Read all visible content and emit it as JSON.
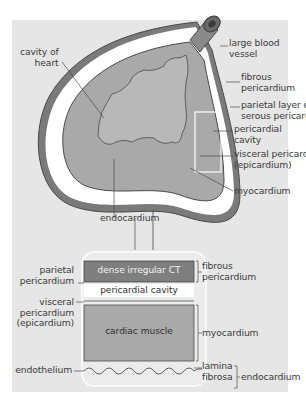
{
  "diagram": {
    "colors": {
      "background": "#e6e6e6",
      "fibrous_pericardium": "#7f7f7f",
      "myocardium": "#a9a9a9",
      "pericardial_cavity": "#ffffff",
      "outline": "#4a4a4a",
      "leader_line": "#4a4a4a"
    },
    "heart_labels": {
      "cavity_of_heart": [
        "cavity of",
        "heart"
      ],
      "large_blood_vessel": [
        "large blood",
        "vessel"
      ],
      "fibrous_pericardium": [
        "fibrous",
        "pericardium"
      ],
      "parietal_layer": [
        "parietal layer of",
        "serous pericardium"
      ],
      "pericardial_cavity": [
        "pericardial",
        "cavity"
      ],
      "visceral_pericardium": [
        "visceral pericardium",
        "(epicardium)"
      ],
      "myocardium": "myocardium",
      "endocardium": "endocardium"
    },
    "inset": {
      "bands": [
        {
          "label": "dense irregular CT"
        },
        {
          "label": "pericardial cavity"
        },
        {
          "label": "cardiac muscle"
        }
      ],
      "left_labels": {
        "parietal_pericardium": [
          "parietal",
          "pericardium"
        ],
        "visceral_pericardium": [
          "visceral",
          "pericardium",
          "(epicardium)"
        ],
        "endothelium": "endothelium"
      },
      "right_labels": {
        "fibrous_pericardium": [
          "fibrous",
          "pericardium"
        ],
        "myocardium": "myocardium",
        "lamina_fibrosa": [
          "lamina",
          "fibrosa"
        ],
        "endocardium": "endocardium"
      }
    }
  }
}
